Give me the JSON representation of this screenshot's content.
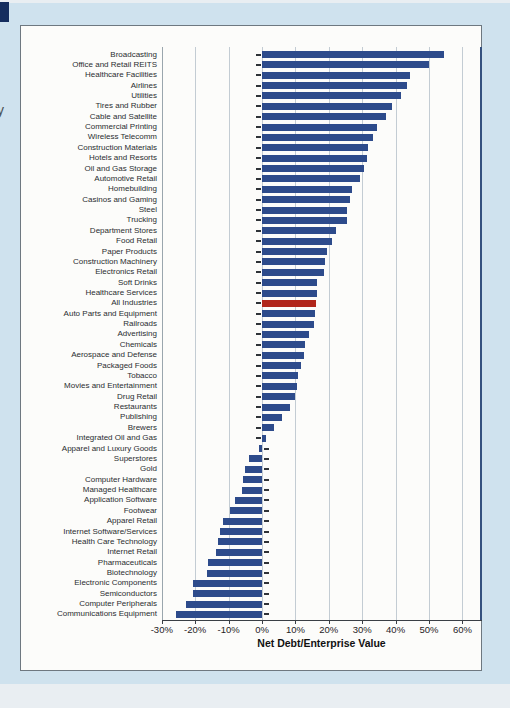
{
  "page": {
    "left_edge_text": "y"
  },
  "chart_data": {
    "type": "bar",
    "orientation": "horizontal",
    "title": "",
    "xlabel": "Net Debt/Enterprise Value",
    "ylabel": "",
    "xlim": [
      -30,
      60
    ],
    "grid": true,
    "unit": "%",
    "bar_color": "#2d4b8b",
    "highlight_color": "#b1261b",
    "highlight_category": "All Industries",
    "x_tick_values": [
      -30,
      -20,
      -10,
      0,
      10,
      20,
      30,
      40,
      50,
      60
    ],
    "x_tick_labels": [
      "-30%",
      "-20%",
      "-10%",
      "0%",
      "10%",
      "20%",
      "30%",
      "40%",
      "50%",
      "60%"
    ],
    "categories": [
      "Broadcasting",
      "Office and Retail REITS",
      "Healthcare Facilities",
      "Airlines",
      "Utilities",
      "Tires and Rubber",
      "Cable and Satellite",
      "Commercial Printing",
      "Wireless Telecomm",
      "Construction Materials",
      "Hotels and Resorts",
      "Oil and Gas Storage",
      "Automotive Retail",
      "Homebuilding",
      "Casinos and Gaming",
      "Steel",
      "Trucking",
      "Department Stores",
      "Food Retail",
      "Paper Products",
      "Construction Machinery",
      "Electronics Retail",
      "Soft Drinks",
      "Healthcare Services",
      "All Industries",
      "Auto Parts and Equipment",
      "Railroads",
      "Advertising",
      "Chemicals",
      "Aerospace and Defense",
      "Packaged Foods",
      "Tobacco",
      "Movies and Entertainment",
      "Drug Retail",
      "Restaurants",
      "Publishing",
      "Brewers",
      "Integrated Oil and Gas",
      "Apparel and Luxury Goods",
      "Superstores",
      "Gold",
      "Computer Hardware",
      "Managed Healthcare",
      "Application Software",
      "Footwear",
      "Apparel Retail",
      "Internet Software/Services",
      "Health Care Technology",
      "Internet Retail",
      "Pharmaceuticals",
      "Biotechnology",
      "Electronic Components",
      "Semiconductors",
      "Computer Peripherals",
      "Communications Equipment"
    ],
    "values": [
      54.5,
      50.0,
      44.2,
      43.5,
      41.6,
      38.8,
      37.2,
      34.4,
      33.2,
      31.6,
      31.4,
      30.4,
      29.4,
      26.9,
      26.4,
      25.5,
      25.3,
      22.2,
      21.1,
      19.6,
      18.9,
      18.6,
      16.5,
      16.4,
      16.3,
      15.8,
      15.7,
      14.2,
      13.0,
      12.6,
      11.6,
      10.8,
      10.4,
      9.8,
      8.3,
      6.0,
      3.5,
      1.1,
      -1.0,
      -4.0,
      -5.0,
      -5.7,
      -6.0,
      -8.0,
      -9.6,
      -11.6,
      -12.5,
      -13.2,
      -13.7,
      -16.2,
      -16.5,
      -20.7,
      -20.7,
      -22.9,
      -25.6
    ]
  }
}
